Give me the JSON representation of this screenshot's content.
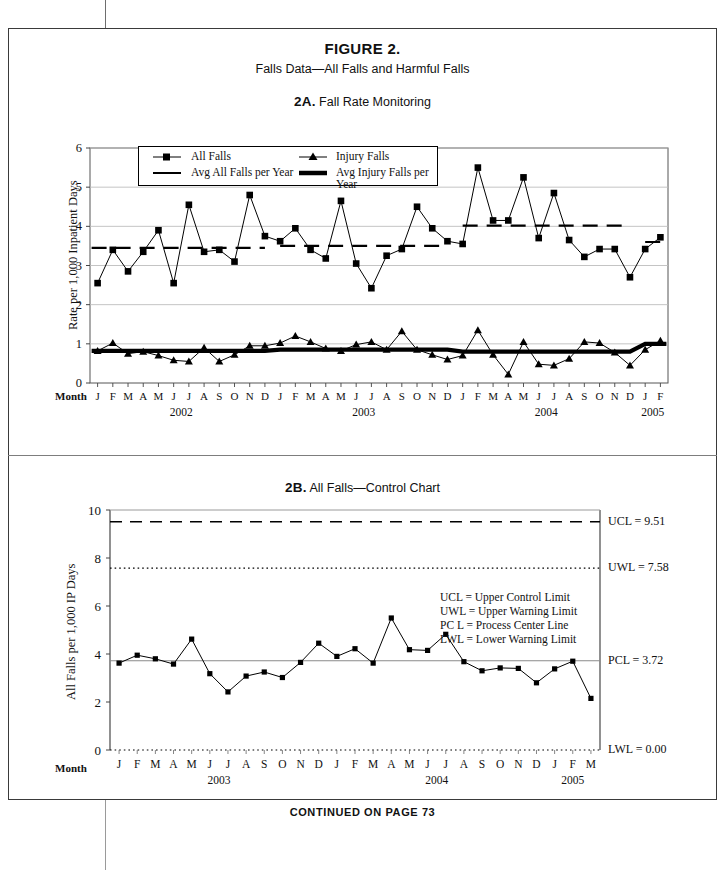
{
  "figure": {
    "title": "FIGURE 2.",
    "subtitle": "Falls Data—All Falls and Harmful Falls",
    "continued": "CONTINUED ON PAGE 73"
  },
  "panel_a": {
    "label": "2A.",
    "title": "Fall Rate Monitoring",
    "month_word": "Month",
    "legend": [
      {
        "label": "All Falls",
        "symbol": "square-marker-line"
      },
      {
        "label": "Injury Falls",
        "symbol": "triangle-marker-line"
      },
      {
        "label": "Avg All Falls per Year",
        "symbol": "thin-line"
      },
      {
        "label": "Avg Injury Falls per Year",
        "symbol": "thick-line"
      }
    ]
  },
  "panel_b": {
    "label": "2B.",
    "title": "All Falls—Control Chart",
    "month_word": "Month",
    "limits": [
      {
        "name": "UCL",
        "text": "UCL = 9.51",
        "value": 9.51,
        "style": "dashed"
      },
      {
        "name": "UWL",
        "text": "UWL = 7.58",
        "value": 7.58,
        "style": "dotted"
      },
      {
        "name": "PCL",
        "text": "PCL = 3.72",
        "value": 3.72,
        "style": "solid"
      },
      {
        "name": "LWL",
        "text": "LWL = 0.00",
        "value": 0.0,
        "style": "dotted"
      }
    ],
    "notes": [
      "UCL = Upper Control Limit",
      "UWL = Upper Warning Limit",
      "PC L = Process Center Line",
      "LWL = Lower Warning Limit"
    ]
  },
  "chart_data": [
    {
      "id": "2A",
      "type": "line",
      "title": "2A. Fall Rate Monitoring",
      "xlabel": "Month",
      "ylabel": "Rate per 1,000 Inpatient Days",
      "ylim": [
        0,
        6
      ],
      "yticks": [
        0,
        1,
        2,
        3,
        4,
        5,
        6
      ],
      "grid": true,
      "legend_position": "top-left-inside",
      "x": [
        "J",
        "F",
        "M",
        "A",
        "M",
        "J",
        "J",
        "A",
        "S",
        "O",
        "N",
        "D",
        "J",
        "F",
        "M",
        "A",
        "M",
        "J",
        "J",
        "A",
        "S",
        "O",
        "N",
        "D",
        "J",
        "F",
        "M",
        "A",
        "M",
        "J",
        "J",
        "A",
        "S",
        "O",
        "N",
        "D",
        "J",
        "F"
      ],
      "year_groups": [
        {
          "year": "2002",
          "start_index": 0,
          "count": 12
        },
        {
          "year": "2003",
          "start_index": 12,
          "count": 12
        },
        {
          "year": "2004",
          "start_index": 24,
          "count": 12
        },
        {
          "year": "2005",
          "start_index": 36,
          "count": 2
        }
      ],
      "series": [
        {
          "name": "All Falls",
          "marker": "square",
          "values": [
            2.55,
            3.4,
            2.85,
            3.35,
            3.9,
            2.55,
            4.55,
            3.35,
            3.4,
            3.1,
            4.8,
            3.75,
            3.62,
            3.95,
            3.4,
            3.18,
            4.65,
            3.05,
            2.42,
            3.25,
            3.42,
            4.5,
            3.95,
            3.62,
            3.55,
            5.5,
            4.15,
            4.15,
            5.25,
            3.7,
            4.85,
            3.65,
            3.22,
            3.42,
            3.42,
            2.7,
            3.42,
            3.72
          ]
        },
        {
          "name": "Injury Falls",
          "marker": "triangle",
          "values": [
            0.82,
            1.02,
            0.75,
            0.8,
            0.7,
            0.58,
            0.55,
            0.9,
            0.55,
            0.72,
            0.95,
            0.95,
            1.02,
            1.2,
            1.05,
            0.88,
            0.82,
            0.98,
            1.05,
            0.85,
            1.32,
            0.85,
            0.72,
            0.6,
            0.7,
            1.35,
            0.72,
            0.22,
            1.05,
            0.48,
            0.45,
            0.62,
            1.05,
            1.02,
            0.78,
            0.45,
            0.85,
            1.08
          ]
        },
        {
          "name": "Avg All Falls per Year",
          "type": "step-line",
          "style": "dashed-thin",
          "segments": [
            {
              "from_index": 0,
              "to_index": 11,
              "value": 3.45
            },
            {
              "from_index": 12,
              "to_index": 23,
              "value": 3.5
            },
            {
              "from_index": 24,
              "to_index": 35,
              "value": 4.02
            },
            {
              "from_index": 36,
              "to_index": 37,
              "value": 3.6
            }
          ]
        },
        {
          "name": "Avg Injury Falls per Year",
          "type": "step-line",
          "style": "solid-thick",
          "segments": [
            {
              "from_index": 0,
              "to_index": 11,
              "value": 0.82
            },
            {
              "from_index": 12,
              "to_index": 23,
              "value": 0.85
            },
            {
              "from_index": 24,
              "to_index": 35,
              "value": 0.8
            },
            {
              "from_index": 36,
              "to_index": 37,
              "value": 1.0
            }
          ]
        }
      ]
    },
    {
      "id": "2B",
      "type": "line",
      "title": "2B. All Falls—Control Chart",
      "xlabel": "Month",
      "ylabel": "All Falls per 1,000 IP Days",
      "ylim": [
        0,
        10
      ],
      "yticks": [
        0,
        2,
        4,
        6,
        8,
        10
      ],
      "grid": false,
      "x": [
        "J",
        "F",
        "M",
        "A",
        "M",
        "J",
        "J",
        "A",
        "S",
        "O",
        "N",
        "D",
        "J",
        "F",
        "M",
        "A",
        "M",
        "J",
        "J",
        "A",
        "S",
        "O",
        "N",
        "D",
        "J",
        "F",
        "M"
      ],
      "year_groups": [
        {
          "year": "2003",
          "start_index": 0,
          "count": 12
        },
        {
          "year": "2004",
          "start_index": 12,
          "count": 12
        },
        {
          "year": "2005",
          "start_index": 24,
          "count": 3
        }
      ],
      "series": [
        {
          "name": "All Falls",
          "marker": "square",
          "values": [
            3.62,
            3.95,
            3.8,
            3.58,
            4.62,
            3.18,
            2.42,
            3.08,
            3.25,
            3.02,
            3.65,
            4.45,
            3.9,
            4.22,
            3.62,
            5.5,
            4.18,
            4.15,
            4.82,
            3.68,
            3.3,
            3.42,
            3.4,
            2.8,
            3.38,
            3.7,
            2.15
          ]
        }
      ],
      "control_limits": {
        "UCL": 9.51,
        "UWL": 7.58,
        "PCL": 3.72,
        "LWL": 0.0
      }
    }
  ]
}
